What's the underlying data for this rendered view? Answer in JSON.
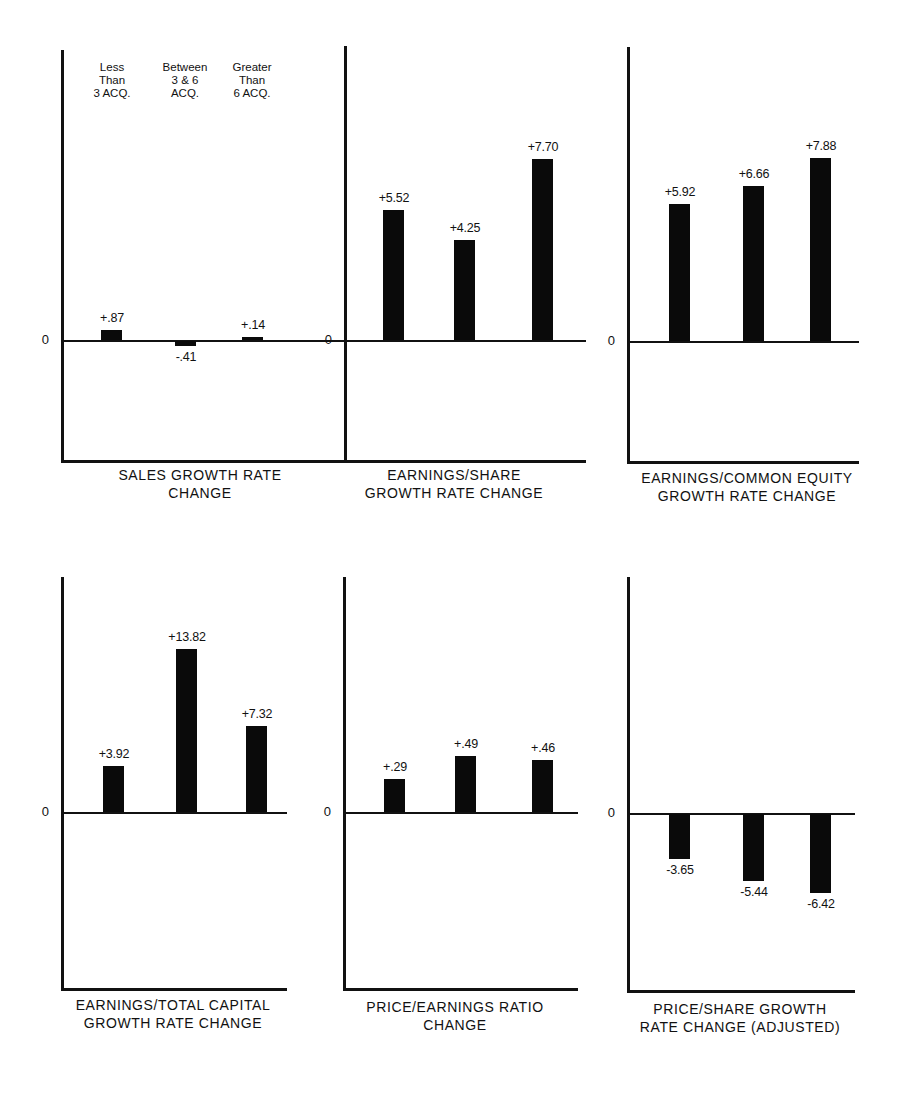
{
  "chart_data": {
    "type": "bar",
    "categories": [
      "Less Than 3 ACQ.",
      "Between 3 & 6 ACQ.",
      "Greater Than 6 ACQ."
    ],
    "category_labels": [
      "Less\nThan\n3 ACQ.",
      "Between\n3 & 6\nACQ.",
      "Greater\nThan\n6 ACQ."
    ],
    "zero_label": "0",
    "panels": [
      {
        "title": "SALES GROWTH RATE\nCHANGE",
        "values": [
          0.87,
          -0.41,
          0.14
        ],
        "labels": [
          "+.87",
          "-.41",
          "+.14"
        ]
      },
      {
        "title": "EARNINGS/SHARE\nGROWTH RATE CHANGE",
        "values": [
          5.52,
          4.25,
          7.7
        ],
        "labels": [
          "+5.52",
          "+4.25",
          "+7.70"
        ]
      },
      {
        "title": "EARNINGS/COMMON EQUITY\nGROWTH RATE CHANGE",
        "values": [
          5.92,
          6.66,
          7.88
        ],
        "labels": [
          "+5.92",
          "+6.66",
          "+7.88"
        ]
      },
      {
        "title": "EARNINGS/TOTAL CAPITAL\nGROWTH RATE CHANGE",
        "values": [
          3.92,
          13.82,
          7.32
        ],
        "labels": [
          "+3.92",
          "+13.82",
          "+7.32"
        ]
      },
      {
        "title": "PRICE/EARNINGS RATIO\nCHANGE",
        "values": [
          0.29,
          0.49,
          0.46
        ],
        "labels": [
          "+.29",
          "+.49",
          "+.46"
        ]
      },
      {
        "title": "PRICE/SHARE GROWTH\nRATE CHANGE (ADJUSTED)",
        "values": [
          -3.65,
          -5.44,
          -6.42
        ],
        "labels": [
          "-3.65",
          "-5.44",
          "-6.42"
        ]
      }
    ],
    "grid": false,
    "legend_position": "top of first panel"
  },
  "layout": {
    "panels": [
      {
        "ax": 61,
        "top": 50,
        "zero": 340,
        "bottom": 460,
        "right": 586,
        "scale": 11.5,
        "bars": [
          101,
          175,
          242
        ],
        "titleX": 60,
        "titleW": 280,
        "titleY": 466
      },
      {
        "ax": 344,
        "top": 46,
        "zero": 340,
        "bottom": 460,
        "right": 555,
        "scale": 23.5,
        "bars": [
          383,
          454,
          532
        ],
        "titleX": 338,
        "titleW": 232,
        "titleY": 466
      },
      {
        "ax": 627,
        "top": 47,
        "zero": 341,
        "bottom": 461,
        "right": 859,
        "scale": 23.2,
        "bars": [
          669,
          743,
          810
        ],
        "titleX": 617,
        "titleW": 260,
        "titleY": 469
      },
      {
        "ax": 61,
        "top": 577,
        "zero": 812,
        "bottom": 988,
        "right": 287,
        "scale": 11.8,
        "bars": [
          103,
          176,
          246
        ],
        "titleX": 48,
        "titleW": 250,
        "titleY": 996
      },
      {
        "ax": 343,
        "top": 577,
        "zero": 812,
        "bottom": 988,
        "right": 578,
        "scale": 114,
        "bars": [
          384,
          455,
          532
        ],
        "titleX": 330,
        "titleW": 250,
        "titleY": 998
      },
      {
        "ax": 627,
        "top": 577,
        "zero": 813,
        "bottom": 990,
        "right": 855,
        "scale": 12.3,
        "bars": [
          669,
          743,
          810
        ],
        "titleX": 610,
        "titleW": 260,
        "titleY": 1000
      }
    ],
    "legendX": [
      82,
      155,
      222
    ]
  }
}
